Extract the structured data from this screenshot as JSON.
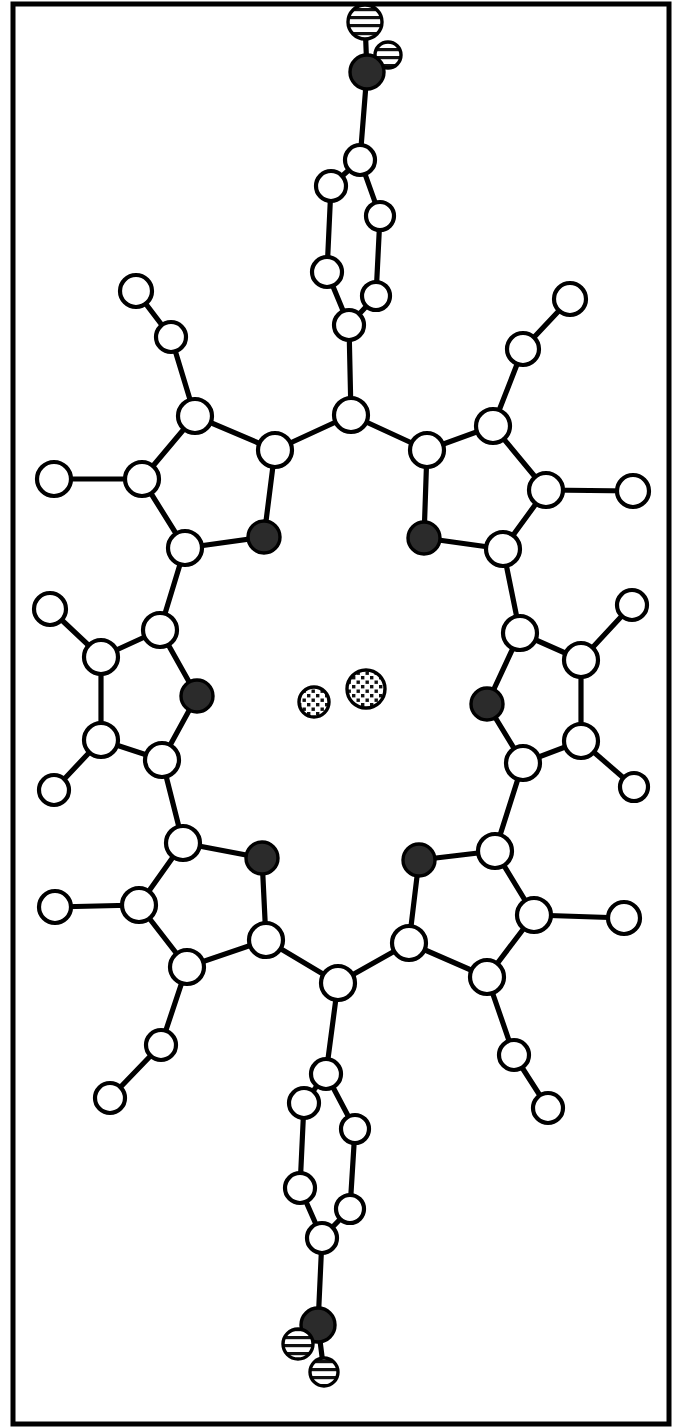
{
  "figure": {
    "kind": "chemical-structure",
    "border_color": "#000000",
    "background_color": "#ffffff",
    "width": 676,
    "height": 1428
  },
  "legend": {
    "atom_styles": [
      {
        "key": "open",
        "name": "carbon-atom",
        "fill": "#ffffff",
        "stroke": "#000000"
      },
      {
        "key": "filled",
        "name": "nitrogen-atom",
        "fill": "#2b2b2b",
        "stroke": "#000000"
      },
      {
        "key": "striped",
        "name": "oxygen-atom",
        "fill": "#ffffff",
        "stroke": "#000000",
        "pattern": "horizontal-stripes"
      },
      {
        "key": "dotted",
        "name": "metal-or-ion-atom",
        "fill": "#ffffff",
        "stroke": "#000000",
        "pattern": "dots"
      }
    ]
  },
  "chart_data": {
    "type": "scatter",
    "title": "Porphyrin macrocycle with nitrophenyl substituents",
    "xlabel": "",
    "ylabel": "",
    "xlim": [
      0,
      676
    ],
    "ylim": [
      0,
      1428
    ],
    "grid": false,
    "legend_position": "none",
    "atoms": [
      {
        "id": "O1",
        "style": "striped",
        "x": 365,
        "y": 22,
        "r": 17
      },
      {
        "id": "O2",
        "style": "striped",
        "x": 388,
        "y": 55,
        "r": 13
      },
      {
        "id": "N1",
        "style": "filled",
        "x": 367,
        "y": 72,
        "r": 17
      },
      {
        "id": "C1",
        "style": "open",
        "x": 360,
        "y": 160,
        "r": 15
      },
      {
        "id": "C2",
        "style": "open",
        "x": 331,
        "y": 186,
        "r": 15
      },
      {
        "id": "C3",
        "style": "open",
        "x": 380,
        "y": 216,
        "r": 14
      },
      {
        "id": "C4",
        "style": "open",
        "x": 327,
        "y": 272,
        "r": 15
      },
      {
        "id": "C5",
        "style": "open",
        "x": 376,
        "y": 296,
        "r": 14
      },
      {
        "id": "C6",
        "style": "open",
        "x": 349,
        "y": 325,
        "r": 15
      },
      {
        "id": "C7",
        "style": "open",
        "x": 351,
        "y": 415,
        "r": 17
      },
      {
        "id": "C8",
        "style": "open",
        "x": 275,
        "y": 450,
        "r": 17
      },
      {
        "id": "N2",
        "style": "filled",
        "x": 264,
        "y": 537,
        "r": 16
      },
      {
        "id": "C9",
        "style": "open",
        "x": 185,
        "y": 548,
        "r": 17
      },
      {
        "id": "C10",
        "style": "open",
        "x": 142,
        "y": 479,
        "r": 17
      },
      {
        "id": "C11",
        "style": "open",
        "x": 195,
        "y": 416,
        "r": 17
      },
      {
        "id": "C12",
        "style": "open",
        "x": 171,
        "y": 337,
        "r": 15
      },
      {
        "id": "C13",
        "style": "open",
        "x": 136,
        "y": 291,
        "r": 16
      },
      {
        "id": "C14",
        "style": "open",
        "x": 54,
        "y": 479,
        "r": 17
      },
      {
        "id": "C15",
        "style": "open",
        "x": 427,
        "y": 450,
        "r": 17
      },
      {
        "id": "N3",
        "style": "filled",
        "x": 424,
        "y": 538,
        "r": 16
      },
      {
        "id": "C16",
        "style": "open",
        "x": 503,
        "y": 549,
        "r": 17
      },
      {
        "id": "C17",
        "style": "open",
        "x": 546,
        "y": 490,
        "r": 17
      },
      {
        "id": "C18",
        "style": "open",
        "x": 493,
        "y": 426,
        "r": 17
      },
      {
        "id": "C19",
        "style": "open",
        "x": 523,
        "y": 349,
        "r": 16
      },
      {
        "id": "C20",
        "style": "open",
        "x": 570,
        "y": 299,
        "r": 16
      },
      {
        "id": "C21",
        "style": "open",
        "x": 633,
        "y": 491,
        "r": 16
      },
      {
        "id": "C22",
        "style": "open",
        "x": 160,
        "y": 630,
        "r": 17
      },
      {
        "id": "N4",
        "style": "filled",
        "x": 197,
        "y": 696,
        "r": 16
      },
      {
        "id": "C23",
        "style": "open",
        "x": 162,
        "y": 760,
        "r": 17
      },
      {
        "id": "C24",
        "style": "open",
        "x": 101,
        "y": 740,
        "r": 17
      },
      {
        "id": "C25",
        "style": "open",
        "x": 101,
        "y": 657,
        "r": 17
      },
      {
        "id": "C26",
        "style": "open",
        "x": 50,
        "y": 609,
        "r": 16
      },
      {
        "id": "C27",
        "style": "open",
        "x": 54,
        "y": 790,
        "r": 15
      },
      {
        "id": "C28",
        "style": "open",
        "x": 520,
        "y": 633,
        "r": 17
      },
      {
        "id": "N5",
        "style": "filled",
        "x": 487,
        "y": 704,
        "r": 16
      },
      {
        "id": "C29",
        "style": "open",
        "x": 523,
        "y": 763,
        "r": 17
      },
      {
        "id": "C30",
        "style": "open",
        "x": 581,
        "y": 741,
        "r": 17
      },
      {
        "id": "C31",
        "style": "open",
        "x": 581,
        "y": 660,
        "r": 17
      },
      {
        "id": "C32",
        "style": "open",
        "x": 632,
        "y": 605,
        "r": 15
      },
      {
        "id": "C33",
        "style": "open",
        "x": 634,
        "y": 787,
        "r": 14
      },
      {
        "id": "C34",
        "style": "open",
        "x": 183,
        "y": 843,
        "r": 17
      },
      {
        "id": "N6",
        "style": "filled",
        "x": 262,
        "y": 858,
        "r": 16
      },
      {
        "id": "C35",
        "style": "open",
        "x": 266,
        "y": 940,
        "r": 17
      },
      {
        "id": "C36",
        "style": "open",
        "x": 187,
        "y": 967,
        "r": 17
      },
      {
        "id": "C37",
        "style": "open",
        "x": 139,
        "y": 905,
        "r": 17
      },
      {
        "id": "C38",
        "style": "open",
        "x": 55,
        "y": 907,
        "r": 16
      },
      {
        "id": "C39",
        "style": "open",
        "x": 161,
        "y": 1045,
        "r": 15
      },
      {
        "id": "C40",
        "style": "open",
        "x": 110,
        "y": 1098,
        "r": 15
      },
      {
        "id": "C41",
        "style": "open",
        "x": 495,
        "y": 851,
        "r": 17
      },
      {
        "id": "N7",
        "style": "filled",
        "x": 419,
        "y": 860,
        "r": 16
      },
      {
        "id": "C42",
        "style": "open",
        "x": 409,
        "y": 943,
        "r": 17
      },
      {
        "id": "C43",
        "style": "open",
        "x": 487,
        "y": 977,
        "r": 17
      },
      {
        "id": "C44",
        "style": "open",
        "x": 534,
        "y": 915,
        "r": 17
      },
      {
        "id": "C45",
        "style": "open",
        "x": 624,
        "y": 918,
        "r": 16
      },
      {
        "id": "C46",
        "style": "open",
        "x": 514,
        "y": 1055,
        "r": 15
      },
      {
        "id": "C47",
        "style": "open",
        "x": 548,
        "y": 1108,
        "r": 15
      },
      {
        "id": "C48",
        "style": "open",
        "x": 338,
        "y": 983,
        "r": 17
      },
      {
        "id": "C49",
        "style": "open",
        "x": 326,
        "y": 1074,
        "r": 15
      },
      {
        "id": "C50",
        "style": "open",
        "x": 304,
        "y": 1103,
        "r": 15
      },
      {
        "id": "C51",
        "style": "open",
        "x": 355,
        "y": 1129,
        "r": 14
      },
      {
        "id": "C52",
        "style": "open",
        "x": 300,
        "y": 1188,
        "r": 15
      },
      {
        "id": "C53",
        "style": "open",
        "x": 350,
        "y": 1209,
        "r": 14
      },
      {
        "id": "C54",
        "style": "open",
        "x": 322,
        "y": 1238,
        "r": 15
      },
      {
        "id": "N8",
        "style": "filled",
        "x": 318,
        "y": 1325,
        "r": 17
      },
      {
        "id": "O3",
        "style": "striped",
        "x": 298,
        "y": 1344,
        "r": 15
      },
      {
        "id": "O4",
        "style": "striped",
        "x": 324,
        "y": 1372,
        "r": 14
      },
      {
        "id": "M1",
        "style": "dotted",
        "x": 314,
        "y": 702,
        "r": 15
      },
      {
        "id": "M2",
        "style": "dotted",
        "x": 366,
        "y": 689,
        "r": 19
      }
    ],
    "bonds": [
      [
        "O1",
        "N1"
      ],
      [
        "O2",
        "N1"
      ],
      [
        "N1",
        "C1"
      ],
      [
        "C1",
        "C2"
      ],
      [
        "C1",
        "C3"
      ],
      [
        "C2",
        "C4"
      ],
      [
        "C3",
        "C5"
      ],
      [
        "C4",
        "C6"
      ],
      [
        "C5",
        "C6"
      ],
      [
        "C6",
        "C7"
      ],
      [
        "C7",
        "C8"
      ],
      [
        "C7",
        "C15"
      ],
      [
        "C8",
        "N2"
      ],
      [
        "N2",
        "C9"
      ],
      [
        "C9",
        "C10"
      ],
      [
        "C10",
        "C11"
      ],
      [
        "C11",
        "C8"
      ],
      [
        "C11",
        "C12"
      ],
      [
        "C12",
        "C13"
      ],
      [
        "C10",
        "C14"
      ],
      [
        "C15",
        "N3"
      ],
      [
        "N3",
        "C16"
      ],
      [
        "C16",
        "C17"
      ],
      [
        "C17",
        "C18"
      ],
      [
        "C18",
        "C15"
      ],
      [
        "C18",
        "C19"
      ],
      [
        "C19",
        "C20"
      ],
      [
        "C17",
        "C21"
      ],
      [
        "C9",
        "C22"
      ],
      [
        "C22",
        "N4"
      ],
      [
        "N4",
        "C23"
      ],
      [
        "C23",
        "C24"
      ],
      [
        "C24",
        "C25"
      ],
      [
        "C25",
        "C22"
      ],
      [
        "C25",
        "C26"
      ],
      [
        "C24",
        "C27"
      ],
      [
        "C16",
        "C28"
      ],
      [
        "C28",
        "N5"
      ],
      [
        "N5",
        "C29"
      ],
      [
        "C29",
        "C30"
      ],
      [
        "C30",
        "C31"
      ],
      [
        "C31",
        "C28"
      ],
      [
        "C31",
        "C32"
      ],
      [
        "C30",
        "C33"
      ],
      [
        "C23",
        "C34"
      ],
      [
        "C34",
        "N6"
      ],
      [
        "N6",
        "C35"
      ],
      [
        "C35",
        "C36"
      ],
      [
        "C36",
        "C37"
      ],
      [
        "C37",
        "C34"
      ],
      [
        "C37",
        "C38"
      ],
      [
        "C36",
        "C39"
      ],
      [
        "C39",
        "C40"
      ],
      [
        "C29",
        "C41"
      ],
      [
        "C41",
        "N7"
      ],
      [
        "N7",
        "C42"
      ],
      [
        "C42",
        "C43"
      ],
      [
        "C43",
        "C44"
      ],
      [
        "C44",
        "C41"
      ],
      [
        "C44",
        "C45"
      ],
      [
        "C43",
        "C46"
      ],
      [
        "C46",
        "C47"
      ],
      [
        "C35",
        "C48"
      ],
      [
        "C42",
        "C48"
      ],
      [
        "C48",
        "C49"
      ],
      [
        "C49",
        "C50"
      ],
      [
        "C49",
        "C51"
      ],
      [
        "C50",
        "C52"
      ],
      [
        "C51",
        "C53"
      ],
      [
        "C52",
        "C54"
      ],
      [
        "C53",
        "C54"
      ],
      [
        "C54",
        "N8"
      ],
      [
        "N8",
        "O3"
      ],
      [
        "N8",
        "O4"
      ]
    ]
  }
}
